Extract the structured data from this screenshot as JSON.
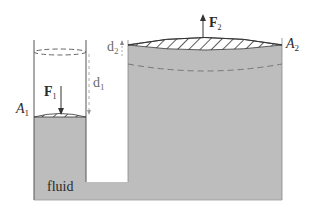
{
  "diagram": {
    "labels": {
      "fluid": "fluid",
      "A1": "A",
      "A1_sub": "1",
      "A2": "A",
      "A2_sub": "2",
      "F1": "F",
      "F1_sub": "1",
      "F2": "F",
      "F2_sub": "2",
      "d1": "d",
      "d1_sub": "1",
      "d2": "d",
      "d2_sub": "2"
    },
    "colors": {
      "fluid": "#bdbdbd",
      "wall": "#555555",
      "dashed": "#7a7a7a",
      "background": "#ffffff"
    }
  }
}
